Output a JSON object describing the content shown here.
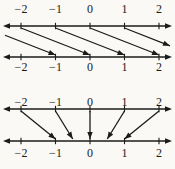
{
  "colors": {
    "background": "#faf9f5",
    "ink": "#1b1b1b"
  },
  "diagrams": [
    {
      "id": "shift-right-map-diagram",
      "source_line": {
        "tick_labels": [
          "−2",
          "−1",
          "0",
          "1",
          "2"
        ],
        "tick_values": [
          -2,
          -1,
          0,
          1,
          2
        ]
      },
      "target_line": {
        "tick_labels": [
          "−2",
          "−1",
          "0",
          "1",
          "2"
        ],
        "tick_values": [
          -2,
          -1,
          0,
          1,
          2
        ]
      },
      "arrows": [
        {
          "from": -3,
          "to": -1
        },
        {
          "from": -2,
          "to": 0
        },
        {
          "from": -1,
          "to": 1
        },
        {
          "from": 0,
          "to": 2
        },
        {
          "from": 1,
          "to": 3
        }
      ]
    },
    {
      "id": "halving-map-diagram",
      "source_line": {
        "tick_labels": [
          "−2",
          "−1",
          "0",
          "1",
          "2"
        ],
        "tick_values": [
          -2,
          -1,
          0,
          1,
          2
        ]
      },
      "target_line": {
        "tick_labels": [
          "−2",
          "−1",
          "0",
          "1",
          "2"
        ],
        "tick_values": [
          -2,
          -1,
          0,
          1,
          2
        ]
      },
      "arrows": [
        {
          "from": -2,
          "to": -1
        },
        {
          "from": -1,
          "to": -0.5
        },
        {
          "from": 0,
          "to": 0
        },
        {
          "from": 1,
          "to": 0.5
        },
        {
          "from": 2,
          "to": 1
        }
      ]
    }
  ]
}
